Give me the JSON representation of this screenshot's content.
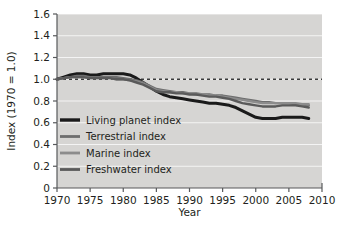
{
  "chart_data": {
    "type": "line",
    "title": "",
    "subtitle": "",
    "xlabel": "Year",
    "ylabel": "Index (1970 = 1.0)",
    "xlim": [
      1970,
      2010
    ],
    "ylim": [
      0,
      1.6
    ],
    "xticks": [
      1970,
      1975,
      1980,
      1985,
      1990,
      1995,
      2000,
      2005,
      2010
    ],
    "xtick_labels": [
      "1970",
      "1975",
      "1980",
      "1985",
      "1990",
      "1995",
      "2000",
      "2005",
      "2010"
    ],
    "yticks": [
      0,
      0.2,
      0.4,
      0.6,
      0.8,
      1.0,
      1.2,
      1.4,
      1.6
    ],
    "ytick_labels": [
      "0",
      "0.2",
      "0.4",
      "0.6",
      "0.8",
      "1.0",
      "1.2",
      "1.4",
      "1.6"
    ],
    "grid": true,
    "grid_color": "#ffffff",
    "plot_background": "#d6d5d3",
    "figure_background": "#ffffff",
    "legend_position": "lower-left",
    "reference_line": {
      "y": 1.0,
      "style": "dashed",
      "color": "#3a3a3a"
    },
    "x": [
      1970,
      1971,
      1972,
      1973,
      1974,
      1975,
      1976,
      1977,
      1978,
      1979,
      1980,
      1981,
      1982,
      1983,
      1984,
      1985,
      1986,
      1987,
      1988,
      1989,
      1990,
      1991,
      1992,
      1993,
      1994,
      1995,
      1996,
      1997,
      1998,
      1999,
      2000,
      2001,
      2002,
      2003,
      2004,
      2005,
      2006,
      2007,
      2008
    ],
    "series": [
      {
        "name": "Living planet index",
        "color": "#1a1a1a",
        "width": 3.0,
        "values": [
          1.0,
          1.02,
          1.04,
          1.05,
          1.05,
          1.04,
          1.04,
          1.05,
          1.05,
          1.05,
          1.05,
          1.04,
          1.01,
          0.97,
          0.93,
          0.89,
          0.86,
          0.84,
          0.83,
          0.82,
          0.81,
          0.8,
          0.79,
          0.78,
          0.78,
          0.77,
          0.76,
          0.74,
          0.71,
          0.68,
          0.65,
          0.64,
          0.64,
          0.64,
          0.65,
          0.65,
          0.65,
          0.65,
          0.64
        ]
      },
      {
        "name": "Terrestrial index",
        "color": "#6e6e6e",
        "width": 2.4,
        "values": [
          1.0,
          1.01,
          1.02,
          1.03,
          1.03,
          1.02,
          1.02,
          1.02,
          1.02,
          1.02,
          1.01,
          1.0,
          0.99,
          0.97,
          0.94,
          0.91,
          0.9,
          0.89,
          0.88,
          0.88,
          0.87,
          0.87,
          0.86,
          0.86,
          0.85,
          0.85,
          0.84,
          0.83,
          0.82,
          0.81,
          0.8,
          0.79,
          0.79,
          0.78,
          0.78,
          0.78,
          0.77,
          0.77,
          0.76
        ]
      },
      {
        "name": "Marine index",
        "color": "#8c8c8c",
        "width": 2.4,
        "values": [
          1.0,
          1.01,
          1.02,
          1.02,
          1.02,
          1.01,
          1.01,
          1.01,
          1.01,
          1.0,
          1.0,
          0.99,
          0.98,
          0.96,
          0.93,
          0.9,
          0.89,
          0.88,
          0.88,
          0.87,
          0.87,
          0.86,
          0.86,
          0.85,
          0.85,
          0.84,
          0.83,
          0.82,
          0.81,
          0.8,
          0.79,
          0.78,
          0.78,
          0.78,
          0.78,
          0.78,
          0.78,
          0.77,
          0.77
        ]
      },
      {
        "name": "Freshwater index",
        "color": "#5a5a5a",
        "width": 2.4,
        "values": [
          1.0,
          1.01,
          1.02,
          1.02,
          1.02,
          1.01,
          1.01,
          1.01,
          1.01,
          1.0,
          1.0,
          0.99,
          0.97,
          0.95,
          0.92,
          0.89,
          0.88,
          0.88,
          0.87,
          0.87,
          0.86,
          0.86,
          0.85,
          0.84,
          0.84,
          0.83,
          0.82,
          0.8,
          0.78,
          0.77,
          0.76,
          0.75,
          0.75,
          0.75,
          0.76,
          0.76,
          0.76,
          0.75,
          0.74
        ]
      }
    ],
    "legend": [
      {
        "label": "Living planet index",
        "color": "#1a1a1a",
        "width": 3.4
      },
      {
        "label": "Terrestrial index",
        "color": "#6e6e6e",
        "width": 2.8
      },
      {
        "label": "Marine index",
        "color": "#8c8c8c",
        "width": 2.8
      },
      {
        "label": "Freshwater index",
        "color": "#5a5a5a",
        "width": 2.8
      }
    ]
  }
}
